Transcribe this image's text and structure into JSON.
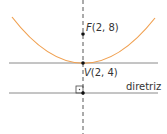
{
  "diagram": {
    "focus": {
      "label": "F(2, 8)",
      "italic_prefix": "F",
      "rest": "(2, 8)"
    },
    "vertex": {
      "label": "V(2, 4)",
      "italic_prefix": "V",
      "rest": "(2, 4)"
    },
    "directrix": {
      "label": "diretriz"
    },
    "colors": {
      "parabola": "#f0a050",
      "lines": "#8a8a8a",
      "axis": "#444444",
      "points": "#111111"
    }
  }
}
